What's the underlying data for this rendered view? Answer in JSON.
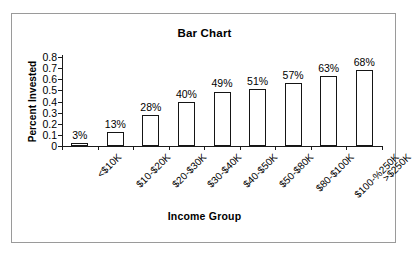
{
  "chart_data": {
    "type": "bar",
    "title": "Bar Chart",
    "xlabel": "Income Group",
    "ylabel": "Percent Invested",
    "categories": [
      "<$10K",
      "$10-$20K",
      "$20-$30K",
      "$30-$40K",
      "$40-$50K",
      "$50-$80K",
      "$80-$100K",
      "$100-%250K",
      ">$250K"
    ],
    "values": [
      0.03,
      0.13,
      0.28,
      0.4,
      0.49,
      0.51,
      0.57,
      0.63,
      0.68
    ],
    "data_labels": [
      "3%",
      "13%",
      "28%",
      "40%",
      "49%",
      "51%",
      "57%",
      "63%",
      "68%"
    ],
    "ylim": [
      0,
      0.8
    ],
    "ytick_labels": [
      "0.8",
      "0.7",
      "0.6",
      "0.5",
      "0.4",
      "0.3",
      "0.2",
      "0.1",
      "0"
    ],
    "ytick_values": [
      0.8,
      0.7,
      0.6,
      0.5,
      0.4,
      0.3,
      0.2,
      0.1,
      0
    ],
    "grid": false,
    "legend": "none",
    "bar_fill_color": "#ffffff",
    "bar_border_color": "#151515",
    "background_color": "#ffffff",
    "frame_color": "#9a9a9a"
  }
}
